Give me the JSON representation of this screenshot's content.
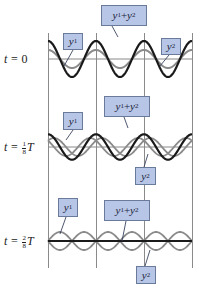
{
  "figure": {
    "type": "standing-wave-superposition",
    "colors": {
      "sum_wave": "#1a1a1a",
      "component_wave": "#8a8a8a",
      "grid": "#888888",
      "label_fill": "#b7c6e6",
      "label_border": "#6a7a9a"
    },
    "rows": [
      {
        "time_label": {
          "prefix": "t = ",
          "value": "0",
          "num": "",
          "den": "",
          "suffix": ""
        },
        "labels": {
          "y1": "y",
          "y1_sub": "1",
          "y2": "y",
          "y2_sub": "2",
          "sum": "y",
          "sum_sub1": "1",
          "sum_plus": " + ",
          "sum_y2": "y",
          "sum_sub2": "2"
        }
      },
      {
        "time_label": {
          "prefix": "t = ",
          "value": "",
          "num": "1",
          "den": "8",
          "suffix": "T"
        },
        "labels": {
          "y1": "y",
          "y1_sub": "1",
          "y2": "y",
          "y2_sub": "2",
          "sum": "y",
          "sum_sub1": "1",
          "sum_plus": " + ",
          "sum_y2": "y",
          "sum_sub2": "2"
        }
      },
      {
        "time_label": {
          "prefix": "t = ",
          "value": "",
          "num": "2",
          "den": "8",
          "suffix": "T"
        },
        "labels": {
          "y1": "y",
          "y1_sub": "1",
          "y2": "y",
          "y2_sub": "2",
          "sum": "y",
          "sum_sub1": "1",
          "sum_plus": " + ",
          "sum_y2": "y",
          "sum_sub2": "2"
        }
      }
    ]
  }
}
